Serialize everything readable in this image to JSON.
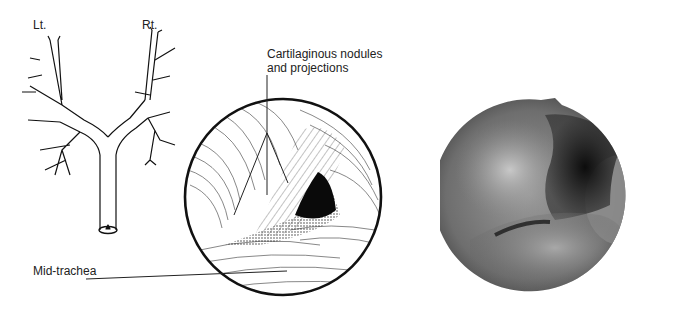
{
  "figure": {
    "schematic": {
      "left_label": "Lt.",
      "right_label": "Rt."
    },
    "drawing": {
      "annotation_top_line1": "Cartilaginous nodules",
      "annotation_top_line2": "and projections",
      "annotation_bottom": "Mid-trachea"
    },
    "photo": {
      "description": "endoscopic-view"
    }
  }
}
